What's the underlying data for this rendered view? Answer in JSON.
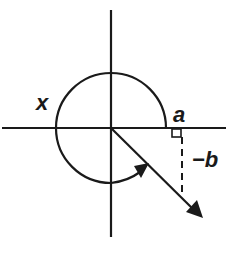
{
  "diagram": {
    "type": "angle-in-standard-position",
    "labels": {
      "angle": "x",
      "horizontal_leg": "a",
      "vertical_leg": "−b"
    },
    "colors": {
      "stroke": "#1a1a1a",
      "background": "#ffffff"
    }
  }
}
